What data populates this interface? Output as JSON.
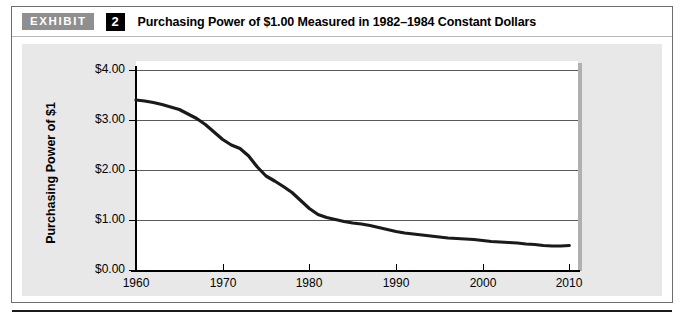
{
  "exhibit": {
    "tag_label": "EXHIBIT",
    "number": "2",
    "title": "Purchasing Power of $1.00 Measured in 1982–1984 Constant Dollars"
  },
  "colors": {
    "tag_background": "#8f8f8f",
    "number_background": "#000000",
    "panel_background": "#e8e8e8",
    "plot_background": "#ffffff",
    "line_color": "#1a1a1a",
    "gridline_color": "#5a5a5a",
    "axis_color": "#000000"
  },
  "chart_data": {
    "type": "line",
    "title": "Purchasing Power of $1.00 Measured in 1982–1984 Constant Dollars",
    "xlabel": "",
    "ylabel": "Purchasing Power of $1",
    "xlim": [
      1960,
      2011
    ],
    "ylim": [
      0.0,
      4.0
    ],
    "grid": true,
    "legend": "none",
    "x_ticks": [
      1960,
      1970,
      1980,
      1990,
      2000,
      2010
    ],
    "x_tick_labels": [
      "1960",
      "1970",
      "1980",
      "1990",
      "2000",
      "2010"
    ],
    "y_ticks": [
      0.0,
      1.0,
      2.0,
      3.0,
      4.0
    ],
    "y_tick_labels": [
      "$0.00",
      "$1.00",
      "$2.00",
      "$3.00",
      "$4.00"
    ],
    "series": [
      {
        "name": "Purchasing Power of $1",
        "x": [
          1960,
          1961,
          1962,
          1963,
          1964,
          1965,
          1966,
          1967,
          1968,
          1969,
          1970,
          1971,
          1972,
          1973,
          1974,
          1975,
          1976,
          1977,
          1978,
          1979,
          1980,
          1981,
          1982,
          1983,
          1984,
          1985,
          1986,
          1987,
          1988,
          1989,
          1990,
          1991,
          1992,
          1993,
          1994,
          1995,
          1996,
          1997,
          1998,
          1999,
          2000,
          2001,
          2002,
          2003,
          2004,
          2005,
          2006,
          2007,
          2008,
          2009,
          2010
        ],
        "values": [
          3.4,
          3.38,
          3.35,
          3.31,
          3.26,
          3.21,
          3.12,
          3.03,
          2.91,
          2.76,
          2.61,
          2.5,
          2.43,
          2.28,
          2.06,
          1.88,
          1.78,
          1.67,
          1.55,
          1.39,
          1.23,
          1.11,
          1.05,
          1.01,
          0.97,
          0.94,
          0.92,
          0.89,
          0.85,
          0.81,
          0.77,
          0.74,
          0.72,
          0.7,
          0.68,
          0.66,
          0.64,
          0.63,
          0.62,
          0.61,
          0.59,
          0.57,
          0.56,
          0.55,
          0.54,
          0.52,
          0.51,
          0.49,
          0.48,
          0.48,
          0.49
        ]
      }
    ]
  }
}
